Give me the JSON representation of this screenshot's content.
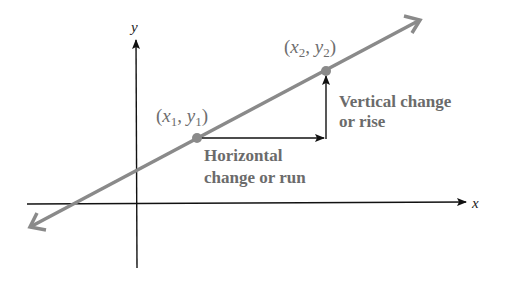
{
  "diagram": {
    "axes": {
      "x_label": "x",
      "y_label": "y"
    },
    "points": [
      {
        "id": "p1",
        "label_x": "x",
        "label_x_sub": "1",
        "label_y": "y",
        "label_y_sub": "1"
      },
      {
        "id": "p2",
        "label_x": "x",
        "label_x_sub": "2",
        "label_y": "y",
        "label_y_sub": "2"
      }
    ],
    "annotations": {
      "vertical_line1": "Vertical change",
      "vertical_line2": "or rise",
      "horizontal_line1": "Horizontal",
      "horizontal_line2": "change or run"
    },
    "colors": {
      "line": "#8a8a8a",
      "point": "#8a8a8a",
      "axes": "#111111",
      "text": "#6b6b6b"
    }
  }
}
